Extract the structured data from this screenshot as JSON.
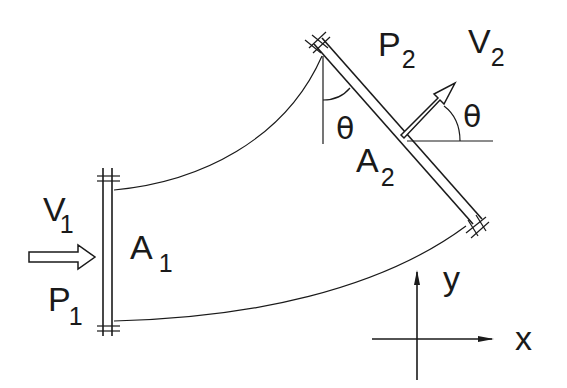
{
  "diagram": {
    "inlet": {
      "velocity_label": "V",
      "velocity_sub": "1",
      "pressure_label": "P",
      "pressure_sub": "1",
      "area_label": "A",
      "area_sub": "1"
    },
    "outlet": {
      "velocity_label": "V",
      "velocity_sub": "2",
      "pressure_label": "P",
      "pressure_sub": "2",
      "area_label": "A",
      "area_sub": "2",
      "angle_label": "θ",
      "angle_label_flange": "θ"
    },
    "axes": {
      "x_label": "x",
      "y_label": "y"
    },
    "colors": {
      "stroke": "#1a1a1a",
      "background": "#ffffff"
    }
  }
}
